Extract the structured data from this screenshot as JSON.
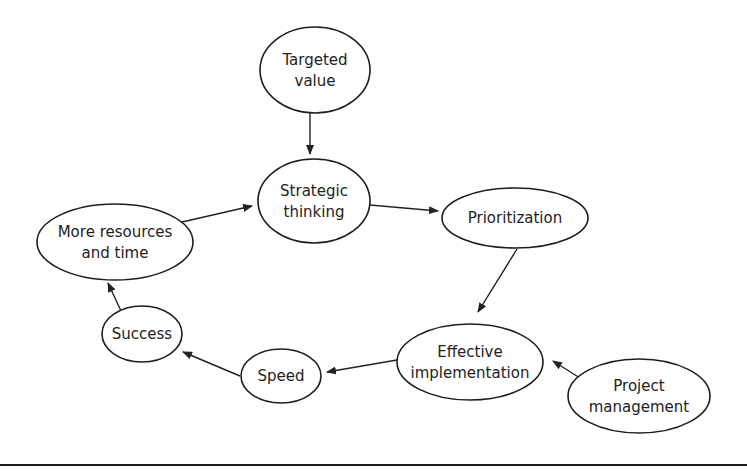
{
  "diagram": {
    "type": "flow-cycle",
    "colors": {
      "stroke": "#1e1e1e",
      "text": "#222222",
      "background": "#ffffff"
    },
    "nodes": [
      {
        "id": "targeted_value",
        "lines": [
          "Targeted",
          "value"
        ],
        "cx": 315,
        "cy": 70,
        "rx": 55,
        "ry": 43
      },
      {
        "id": "strategic_thinking",
        "lines": [
          "Strategic",
          "thinking"
        ],
        "cx": 314,
        "cy": 201,
        "rx": 56,
        "ry": 42
      },
      {
        "id": "prioritization",
        "lines": [
          "Prioritization"
        ],
        "cx": 515,
        "cy": 218,
        "rx": 73,
        "ry": 30
      },
      {
        "id": "effective_implementation",
        "lines": [
          "Effective",
          "implementation"
        ],
        "cx": 470,
        "cy": 362,
        "rx": 73,
        "ry": 38
      },
      {
        "id": "project_management",
        "lines": [
          "Project",
          "management"
        ],
        "cx": 639,
        "cy": 396,
        "rx": 71,
        "ry": 37
      },
      {
        "id": "speed",
        "lines": [
          "Speed"
        ],
        "cx": 281,
        "cy": 376,
        "rx": 40,
        "ry": 27
      },
      {
        "id": "success",
        "lines": [
          "Success"
        ],
        "cx": 142,
        "cy": 334,
        "rx": 40,
        "ry": 28
      },
      {
        "id": "more_resources",
        "lines": [
          "More resources",
          "and time"
        ],
        "cx": 115,
        "cy": 242,
        "rx": 78,
        "ry": 38
      }
    ],
    "edges": [
      {
        "from": "targeted_value",
        "to": "strategic_thinking",
        "x1": 310,
        "y1": 113,
        "x2": 310,
        "y2": 154
      },
      {
        "from": "strategic_thinking",
        "to": "prioritization",
        "x1": 370,
        "y1": 205,
        "x2": 438,
        "y2": 211
      },
      {
        "from": "prioritization",
        "to": "effective_implementation",
        "x1": 517,
        "y1": 249,
        "x2": 478,
        "y2": 312
      },
      {
        "from": "project_management",
        "to": "effective_implementation",
        "x1": 580,
        "y1": 378,
        "x2": 553,
        "y2": 361
      },
      {
        "from": "effective_implementation",
        "to": "speed",
        "x1": 397,
        "y1": 360,
        "x2": 327,
        "y2": 372
      },
      {
        "from": "speed",
        "to": "success",
        "x1": 240,
        "y1": 376,
        "x2": 183,
        "y2": 352
      },
      {
        "from": "success",
        "to": "more_resources",
        "x1": 121,
        "y1": 311,
        "x2": 108,
        "y2": 283
      },
      {
        "from": "more_resources",
        "to": "strategic_thinking",
        "x1": 182,
        "y1": 222,
        "x2": 252,
        "y2": 206
      }
    ],
    "rule": {
      "y": 464,
      "height": 2
    }
  }
}
